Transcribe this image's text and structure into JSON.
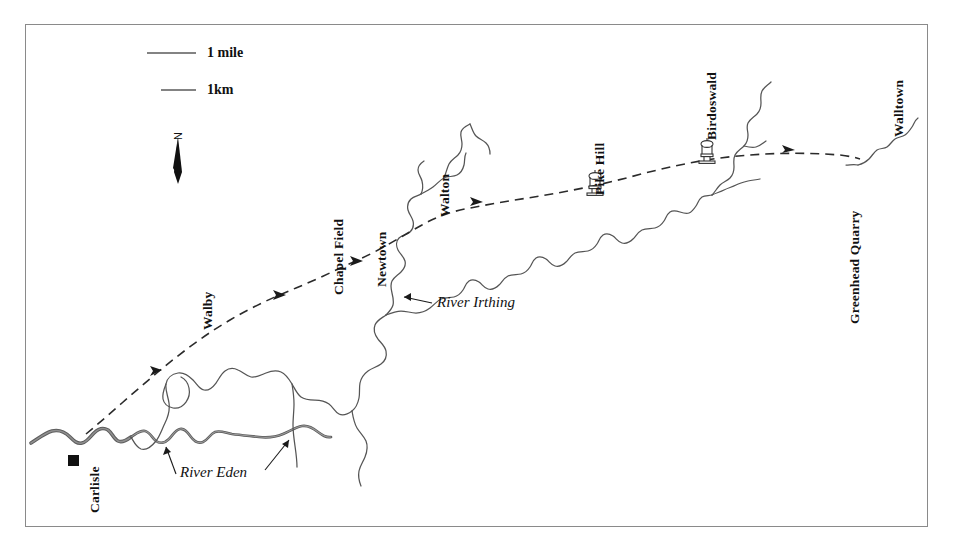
{
  "figure": {
    "frame_color": "#8a8a8a",
    "ink_color": "#333333",
    "background": "#ffffff"
  },
  "legend": {
    "scale_mile_label": "1 mile",
    "scale_km_label": "1km",
    "north_label": "N"
  },
  "places": [
    {
      "label": "Carlisle",
      "marker": "filled-square"
    },
    {
      "label": "Walby",
      "marker": "none"
    },
    {
      "label": "Chapel Field",
      "marker": "none"
    },
    {
      "label": "Newtown",
      "marker": "none"
    },
    {
      "label": "Walton",
      "marker": "none"
    },
    {
      "label": "Pike Hill",
      "marker": "turret-tower"
    },
    {
      "label": "Birdoswald",
      "marker": "turret-tower"
    },
    {
      "label": "Walltown",
      "marker": "none"
    },
    {
      "label": "Greenhead Quarry",
      "marker": "none"
    }
  ],
  "rivers": [
    {
      "label": "River Eden"
    },
    {
      "label": "River Irthing"
    }
  ],
  "route": {
    "name": "Hadrian's Wall line",
    "style": "dashed-with-arrowheads",
    "arrow_count": 5
  }
}
